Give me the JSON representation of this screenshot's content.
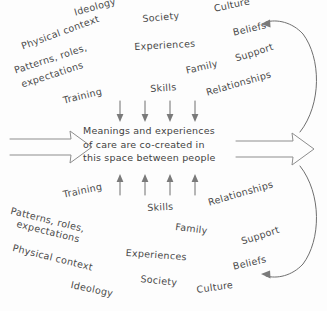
{
  "diagram": {
    "center_statement": {
      "line1": "Meanings and experiences",
      "line2": "of care are co-created in",
      "line3": "this space between people"
    },
    "top_left_cluster": [
      "Ideology",
      "Physical context",
      "Patterns, roles,",
      "expectations",
      "Training"
    ],
    "top_center_cluster": [
      "Society",
      "Experiences",
      "Skills",
      "Family"
    ],
    "top_right_cluster": [
      "Culture",
      "Beliefs",
      "Support",
      "Relationships"
    ],
    "bottom_left_cluster": [
      "Training",
      "Patterns, roles,",
      "expectations",
      "Physical context",
      "Ideology"
    ],
    "bottom_center_cluster": [
      "Skills",
      "Family",
      "Experiences",
      "Society"
    ],
    "bottom_right_cluster": [
      "Relationships",
      "Support",
      "Beliefs",
      "Culture"
    ],
    "colors": {
      "ink": "#4a4a4a",
      "stroke": "#8d8d8d",
      "background": "#fdfdfd"
    }
  }
}
